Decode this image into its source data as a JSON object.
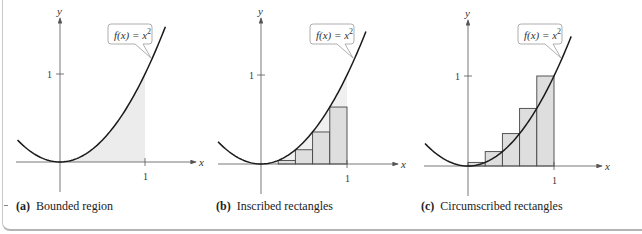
{
  "figure": {
    "panels": [
      {
        "id": "a",
        "letter": "(a)",
        "caption": "Bounded region",
        "function_label": "f(x) = x",
        "function_exponent": "2",
        "x_axis_label": "x",
        "y_axis_label": "y",
        "x_tick": "1",
        "y_tick": "1"
      },
      {
        "id": "b",
        "letter": "(b)",
        "caption": "Inscribed rectangles",
        "function_label": "f(x) = x",
        "function_exponent": "2",
        "x_axis_label": "x",
        "y_axis_label": "y",
        "x_tick": "1",
        "y_tick": "1"
      },
      {
        "id": "c",
        "letter": "(c)",
        "caption": "Circumscribed rectangles",
        "function_label": "f(x) = x",
        "function_exponent": "2",
        "x_axis_label": "x",
        "y_axis_label": "y",
        "x_tick": "1",
        "y_tick": "1"
      }
    ],
    "colors": {
      "curve": "#1a1a1a",
      "axis": "#555555",
      "shade": "#ececec",
      "rect_fill": "#dedede",
      "rect_stroke": "#444444"
    }
  },
  "chart_data": [
    {
      "type": "line",
      "title": "(a) Bounded region",
      "function": "f(x) = x^2",
      "x_range": [
        -0.5,
        1.25
      ],
      "shaded_interval": [
        0,
        1
      ],
      "xlabel": "x",
      "ylabel": "y",
      "x_ticks": [
        1
      ],
      "y_ticks": [
        1
      ]
    },
    {
      "type": "bar",
      "title": "(b) Inscribed rectangles",
      "function": "f(x) = x^2",
      "rectangles": [
        {
          "x0": 0.0,
          "x1": 0.2,
          "height": 0.0
        },
        {
          "x0": 0.2,
          "x1": 0.4,
          "height": 0.04
        },
        {
          "x0": 0.4,
          "x1": 0.6,
          "height": 0.16
        },
        {
          "x0": 0.6,
          "x1": 0.8,
          "height": 0.36
        },
        {
          "x0": 0.8,
          "x1": 1.0,
          "height": 0.64
        }
      ],
      "xlabel": "x",
      "ylabel": "y",
      "x_ticks": [
        1
      ],
      "y_ticks": [
        1
      ]
    },
    {
      "type": "bar",
      "title": "(c) Circumscribed rectangles",
      "function": "f(x) = x^2",
      "rectangles": [
        {
          "x0": 0.0,
          "x1": 0.2,
          "height": 0.04
        },
        {
          "x0": 0.2,
          "x1": 0.4,
          "height": 0.16
        },
        {
          "x0": 0.4,
          "x1": 0.6,
          "height": 0.36
        },
        {
          "x0": 0.6,
          "x1": 0.8,
          "height": 0.64
        },
        {
          "x0": 0.8,
          "x1": 1.0,
          "height": 1.0
        }
      ],
      "xlabel": "x",
      "ylabel": "y",
      "x_ticks": [
        1
      ],
      "y_ticks": [
        1
      ]
    }
  ]
}
